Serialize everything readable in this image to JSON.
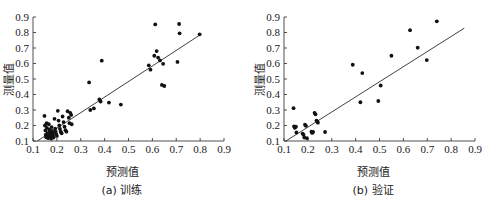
{
  "figure": {
    "background_color": "#ffffff",
    "point_color": "#111111",
    "line_color": "#2b2b2b",
    "axis_color": "#3c3c3c"
  },
  "chart_data": [
    {
      "type": "scatter",
      "panel": "a",
      "title": "",
      "caption": "(a) 训练",
      "xlabel": "预测值",
      "ylabel": "测量值",
      "xlim": [
        0.1,
        0.9
      ],
      "ylim": [
        0.1,
        0.9
      ],
      "xticks": [
        0.1,
        0.2,
        0.3,
        0.4,
        0.5,
        0.6,
        0.7,
        0.8,
        0.9
      ],
      "yticks": [
        0.1,
        0.2,
        0.3,
        0.4,
        0.5,
        0.6,
        0.7,
        0.8,
        0.9
      ],
      "xtick_labels": [
        "0.1",
        "0.2",
        "0.3",
        "0.4",
        "0.5",
        "0.6",
        "0.7",
        "0.8",
        "0.9"
      ],
      "ytick_labels": [
        "0.1",
        "0.2",
        "0.3",
        "0.4",
        "0.5",
        "0.6",
        "0.7",
        "0.8",
        "0.9"
      ],
      "grid": false,
      "legend": null,
      "fit_line": {
        "x": [
          0.118,
          0.805
        ],
        "y": [
          0.1,
          0.79
        ]
      },
      "points": [
        [
          0.148,
          0.262
        ],
        [
          0.15,
          0.2
        ],
        [
          0.152,
          0.168
        ],
        [
          0.153,
          0.14
        ],
        [
          0.155,
          0.125
        ],
        [
          0.157,
          0.215
        ],
        [
          0.158,
          0.185
        ],
        [
          0.16,
          0.15
        ],
        [
          0.162,
          0.132
        ],
        [
          0.163,
          0.118
        ],
        [
          0.166,
          0.208
        ],
        [
          0.168,
          0.175
        ],
        [
          0.17,
          0.158
        ],
        [
          0.172,
          0.143
        ],
        [
          0.174,
          0.128
        ],
        [
          0.176,
          0.115
        ],
        [
          0.178,
          0.19
        ],
        [
          0.18,
          0.165
        ],
        [
          0.182,
          0.15
        ],
        [
          0.184,
          0.138
        ],
        [
          0.186,
          0.122
        ],
        [
          0.19,
          0.243
        ],
        [
          0.193,
          0.18
        ],
        [
          0.195,
          0.16
        ],
        [
          0.197,
          0.145
        ],
        [
          0.2,
          0.133
        ],
        [
          0.204,
          0.295
        ],
        [
          0.207,
          0.232
        ],
        [
          0.21,
          0.2
        ],
        [
          0.213,
          0.178
        ],
        [
          0.216,
          0.16
        ],
        [
          0.22,
          0.15
        ],
        [
          0.224,
          0.258
        ],
        [
          0.228,
          0.222
        ],
        [
          0.232,
          0.192
        ],
        [
          0.236,
          0.17
        ],
        [
          0.24,
          0.16
        ],
        [
          0.245,
          0.292
        ],
        [
          0.25,
          0.25
        ],
        [
          0.253,
          0.215
        ],
        [
          0.256,
          0.282
        ],
        [
          0.26,
          0.268
        ],
        [
          0.262,
          0.208
        ],
        [
          0.335,
          0.478
        ],
        [
          0.34,
          0.3
        ],
        [
          0.355,
          0.31
        ],
        [
          0.378,
          0.368
        ],
        [
          0.383,
          0.355
        ],
        [
          0.388,
          0.618
        ],
        [
          0.418,
          0.348
        ],
        [
          0.468,
          0.335
        ],
        [
          0.585,
          0.588
        ],
        [
          0.592,
          0.56
        ],
        [
          0.608,
          0.65
        ],
        [
          0.612,
          0.852
        ],
        [
          0.618,
          0.68
        ],
        [
          0.624,
          0.638
        ],
        [
          0.632,
          0.62
        ],
        [
          0.64,
          0.462
        ],
        [
          0.645,
          0.598
        ],
        [
          0.65,
          0.455
        ],
        [
          0.705,
          0.61
        ],
        [
          0.712,
          0.855
        ],
        [
          0.714,
          0.795
        ],
        [
          0.798,
          0.788
        ]
      ]
    },
    {
      "type": "scatter",
      "panel": "b",
      "title": "",
      "caption": "(b) 验证",
      "xlabel": "预测值",
      "ylabel": "测量值",
      "xlim": [
        0.1,
        0.9
      ],
      "ylim": [
        0.1,
        0.9
      ],
      "xticks": [
        0.1,
        0.2,
        0.3,
        0.4,
        0.5,
        0.6,
        0.7,
        0.8,
        0.9
      ],
      "yticks": [
        0.1,
        0.2,
        0.3,
        0.4,
        0.5,
        0.6,
        0.7,
        0.8,
        0.9
      ],
      "xtick_labels": [
        "0.1",
        "0.2",
        "0.3",
        "0.4",
        "0.5",
        "0.6",
        "0.7",
        "0.8",
        "0.9"
      ],
      "ytick_labels": [
        "0.1",
        "0.2",
        "0.3",
        "0.4",
        "0.5",
        "0.6",
        "0.7",
        "0.8",
        "0.9"
      ],
      "grid": false,
      "legend": null,
      "fit_line": {
        "x": [
          0.108,
          0.855
        ],
        "y": [
          0.1,
          0.828
        ]
      },
      "points": [
        [
          0.14,
          0.312
        ],
        [
          0.142,
          0.195
        ],
        [
          0.145,
          0.185
        ],
        [
          0.15,
          0.192
        ],
        [
          0.152,
          0.155
        ],
        [
          0.178,
          0.148
        ],
        [
          0.182,
          0.14
        ],
        [
          0.185,
          0.122
        ],
        [
          0.188,
          0.205
        ],
        [
          0.192,
          0.198
        ],
        [
          0.196,
          0.118
        ],
        [
          0.215,
          0.16
        ],
        [
          0.218,
          0.152
        ],
        [
          0.222,
          0.158
        ],
        [
          0.228,
          0.282
        ],
        [
          0.232,
          0.272
        ],
        [
          0.236,
          0.232
        ],
        [
          0.24,
          0.225
        ],
        [
          0.242,
          0.218
        ],
        [
          0.272,
          0.158
        ],
        [
          0.388,
          0.592
        ],
        [
          0.42,
          0.35
        ],
        [
          0.428,
          0.538
        ],
        [
          0.495,
          0.358
        ],
        [
          0.505,
          0.458
        ],
        [
          0.55,
          0.65
        ],
        [
          0.628,
          0.815
        ],
        [
          0.66,
          0.702
        ],
        [
          0.698,
          0.622
        ],
        [
          0.74,
          0.872
        ]
      ]
    }
  ]
}
